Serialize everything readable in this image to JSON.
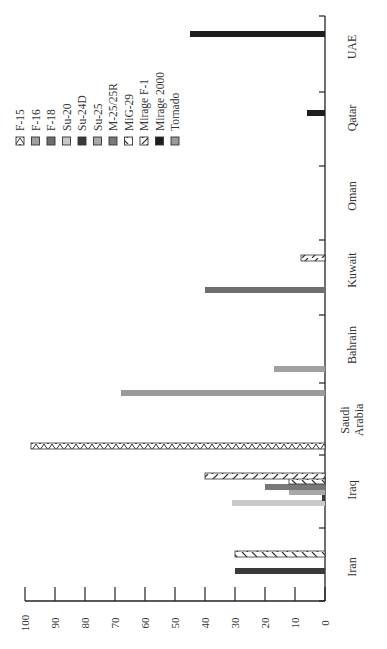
{
  "chart_data": {
    "type": "bar",
    "orientation": "rotated (printed sideways; value axis runs horizontally at bottom, categories along right side)",
    "title": "",
    "xlabel": "",
    "ylabel": "",
    "ylim": [
      0,
      100
    ],
    "value_ticks": [
      "0",
      "10",
      "20",
      "30",
      "40",
      "50",
      "60",
      "70",
      "80",
      "90",
      "100"
    ],
    "categories": [
      "Iran",
      "Iraq",
      "Saudi Arabia",
      "Bahrain",
      "Kuwait",
      "Oman",
      "Qatar",
      "UAE"
    ],
    "legend_position": "upper-left (rotated)",
    "series": [
      {
        "name": "F-15",
        "fill": "#ffffff",
        "pattern": "zigzag",
        "values": [
          0,
          0,
          98,
          0,
          0,
          0,
          0,
          0
        ]
      },
      {
        "name": "F-16",
        "fill": "#a0a0a0",
        "pattern": "solid",
        "values": [
          0,
          0,
          0,
          17,
          0,
          0,
          0,
          0
        ]
      },
      {
        "name": "F-18",
        "fill": "#6e6e6e",
        "pattern": "solid",
        "values": [
          0,
          0,
          0,
          0,
          40,
          0,
          0,
          0
        ]
      },
      {
        "name": "Su-20",
        "fill": "#c8c8c8",
        "pattern": "solid",
        "values": [
          0,
          31,
          0,
          0,
          0,
          0,
          0,
          0
        ]
      },
      {
        "name": "Su-24D",
        "fill": "#3a3a3a",
        "pattern": "solid",
        "values": [
          30,
          1,
          0,
          0,
          0,
          0,
          0,
          0
        ]
      },
      {
        "name": "Su-25",
        "fill": "#a8a8a8",
        "pattern": "solid",
        "values": [
          0,
          12,
          0,
          0,
          0,
          0,
          0,
          0
        ]
      },
      {
        "name": "M-25/25R",
        "fill": "#787878",
        "pattern": "solid",
        "values": [
          0,
          20,
          0,
          0,
          0,
          0,
          0,
          0
        ]
      },
      {
        "name": "MiG-29",
        "fill": "#ffffff",
        "pattern": "backslash",
        "values": [
          30,
          12,
          0,
          0,
          0,
          0,
          0,
          0
        ]
      },
      {
        "name": "Mirage F-1",
        "fill": "#ffffff",
        "pattern": "slash",
        "values": [
          0,
          40,
          0,
          0,
          8,
          0,
          0,
          0
        ]
      },
      {
        "name": "Mirage 2000",
        "fill": "#1e1e1e",
        "pattern": "solid",
        "values": [
          0,
          0,
          0,
          0,
          0,
          0,
          6,
          45
        ]
      },
      {
        "name": "Tornado",
        "fill": "#9a9a9a",
        "pattern": "solid",
        "values": [
          0,
          0,
          68,
          0,
          0,
          0,
          0,
          0
        ]
      }
    ]
  },
  "layout": {
    "axis_x0": 325,
    "axis_x100": 25,
    "axis_bottom_y": 601,
    "axis_top_y": 16,
    "category_ticks_y": [
      601,
      528,
      455,
      383,
      315,
      240,
      166,
      92,
      16
    ],
    "bars": [
      {
        "series": "Su-24D",
        "category": "Iran",
        "y": 571,
        "value": 30
      },
      {
        "series": "MiG-29",
        "category": "Iran",
        "y": 554,
        "value": 30
      },
      {
        "series": "Su-20",
        "category": "Iraq",
        "y": 503,
        "value": 31
      },
      {
        "series": "Su-24D",
        "category": "Iraq",
        "y": 498,
        "value": 1
      },
      {
        "series": "Su-25",
        "category": "Iraq",
        "y": 492,
        "value": 12
      },
      {
        "series": "M-25/25R",
        "category": "Iraq",
        "y": 487,
        "value": 20
      },
      {
        "series": "MiG-29",
        "category": "Iraq",
        "y": 481,
        "value": 12
      },
      {
        "series": "Mirage F-1",
        "category": "Iraq",
        "y": 476,
        "value": 40
      },
      {
        "series": "F-15",
        "category": "Saudi Arabia",
        "y": 446,
        "value": 98
      },
      {
        "series": "Tornado",
        "category": "Saudi Arabia",
        "y": 393,
        "value": 68
      },
      {
        "series": "F-16",
        "category": "Bahrain",
        "y": 369,
        "value": 17
      },
      {
        "series": "F-18",
        "category": "Kuwait",
        "y": 290,
        "value": 40
      },
      {
        "series": "Mirage F-1",
        "category": "Kuwait",
        "y": 258,
        "value": 8
      },
      {
        "series": "Mirage 2000",
        "category": "Qatar",
        "y": 113,
        "value": 6
      },
      {
        "series": "Mirage 2000",
        "category": "UAE",
        "y": 34,
        "value": 45
      }
    ],
    "category_label_pos": [
      {
        "label": "Iran",
        "x": 356,
        "y": 567
      },
      {
        "label": "Iraq",
        "x": 356,
        "y": 490
      },
      {
        "label": "Saudi",
        "x": 349,
        "y": 420
      },
      {
        "label": "Arabia",
        "x": 363,
        "y": 420
      },
      {
        "label": "Bahrain",
        "x": 356,
        "y": 345
      },
      {
        "label": "Kuwait",
        "x": 356,
        "y": 270
      },
      {
        "label": "Oman",
        "x": 356,
        "y": 196
      },
      {
        "label": "Qatar",
        "x": 356,
        "y": 118
      },
      {
        "label": "UAE",
        "x": 356,
        "y": 47
      }
    ]
  }
}
